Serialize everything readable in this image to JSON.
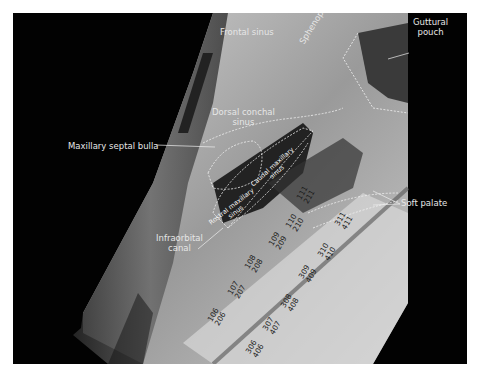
{
  "figure": {
    "labels": {
      "frontal_sinus": "Frontal sinus",
      "sphenopalatine_sinus": "Sphenopalatine sinus",
      "guttural_pouch_line1": "Guttural",
      "guttural_pouch_line2": "pouch",
      "dorsal_conchal_line1": "Dorsal conchal",
      "dorsal_conchal_line2": "sinus",
      "maxillary_septal_bulla": "Maxillary septal bulla",
      "caudal_maxillary_line1": "Caudal maxillary",
      "caudal_maxillary_line2": "sinus",
      "rostral_maxillary_line1": "Rostral maxillary",
      "rostral_maxillary_line2": "sinus",
      "soft_palate": "Soft palate",
      "infraorbital_line1": "Infraorbital",
      "infraorbital_line2": "canal"
    },
    "upper_teeth": [
      {
        "top": "106",
        "bottom": "206"
      },
      {
        "top": "107",
        "bottom": "207"
      },
      {
        "top": "108",
        "bottom": "208"
      },
      {
        "top": "109",
        "bottom": "209"
      },
      {
        "top": "110",
        "bottom": "210"
      },
      {
        "top": "111",
        "bottom": "211"
      }
    ],
    "lower_teeth": [
      {
        "top": "306",
        "bottom": "406"
      },
      {
        "top": "307",
        "bottom": "407"
      },
      {
        "top": "308",
        "bottom": "408"
      },
      {
        "top": "309",
        "bottom": "409"
      },
      {
        "top": "310",
        "bottom": "410"
      },
      {
        "top": "311",
        "bottom": "411"
      }
    ]
  }
}
